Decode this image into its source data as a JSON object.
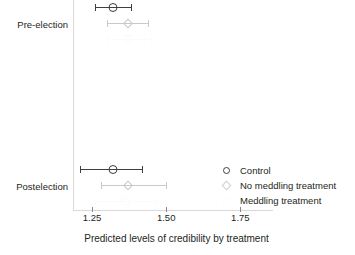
{
  "chart_data": {
    "type": "scatter",
    "subtype": "dot-and-whisker coefficient plot",
    "title": "",
    "xlabel": "Predicted levels of credibility by treatment",
    "ylabel": "",
    "xlim": [
      1.186,
      1.86
    ],
    "xticks": [
      1.25,
      1.5,
      1.75
    ],
    "xticklabels": [
      "1.25",
      "1.50",
      "1.75"
    ],
    "categories": [
      "Pre-election",
      "Postelection"
    ],
    "grid": false,
    "legend_position": "right-middle",
    "legend": [
      "Control",
      "No meddling treatment",
      "Meddling treatment"
    ],
    "series": [
      {
        "name": "Control",
        "marker": "circle",
        "color": "#3f3f3f",
        "points": [
          {
            "category": "Pre-election",
            "estimate": 1.32,
            "ci_low": 1.26,
            "ci_high": 1.38
          },
          {
            "category": "Postelection",
            "estimate": 1.32,
            "ci_low": 1.21,
            "ci_high": 1.42
          }
        ]
      },
      {
        "name": "No meddling treatment",
        "marker": "diamond",
        "color": "#c9c9c9",
        "points": [
          {
            "category": "Pre-election",
            "estimate": 1.37,
            "ci_low": 1.3,
            "ci_high": 1.44
          },
          {
            "category": "Postelection",
            "estimate": 1.37,
            "ci_low": 1.28,
            "ci_high": 1.5
          }
        ]
      },
      {
        "name": "Meddling treatment",
        "marker": "square",
        "color": "#fbfbfb",
        "points": [
          {
            "category": "Pre-election",
            "estimate": 1.37,
            "ci_low": 1.3,
            "ci_high": 1.45
          },
          {
            "category": "Postelection",
            "estimate": 1.36,
            "ci_low": 1.26,
            "ci_high": 1.47
          }
        ]
      }
    ]
  },
  "axis": {
    "x_title": "Predicted levels of credibility by treatment",
    "tick_labels": [
      "1.25",
      "1.50",
      "1.75"
    ]
  },
  "categories": {
    "pre_election": "Pre-election",
    "postelection": "Postelection"
  },
  "legend": {
    "items": [
      {
        "label": "Control",
        "glyph": "circle-marker-icon"
      },
      {
        "label": "No meddling treatment",
        "glyph": "diamond-marker-icon"
      },
      {
        "label": "Meddling treatment",
        "glyph": "faint-marker-icon"
      }
    ]
  }
}
